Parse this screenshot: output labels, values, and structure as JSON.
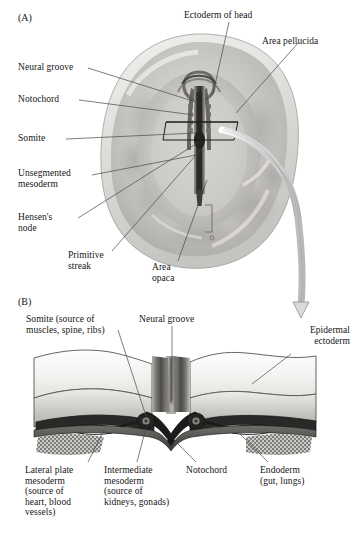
{
  "figure": {
    "domain_note": "two-panel embryology illustration",
    "panels": [
      {
        "tag": "(A)",
        "name": "dorsal-view-chick-embryo"
      },
      {
        "tag": "(B)",
        "name": "transverse-section-neural-groove"
      }
    ]
  },
  "panel_a": {
    "tag": "(A)",
    "labels": [
      {
        "id": "ectoderm-of-head",
        "text": "Ectoderm of head"
      },
      {
        "id": "area-pellucida",
        "text": "Area pellucida"
      },
      {
        "id": "neural-groove",
        "text": "Neural groove"
      },
      {
        "id": "notochord",
        "text": "Notochord"
      },
      {
        "id": "somite",
        "text": "Somite"
      },
      {
        "id": "unsegmented-mesoderm",
        "text": "Unsegmented\nmesoderm"
      },
      {
        "id": "hensens-node",
        "text": "Hensen's\nnode"
      },
      {
        "id": "primitive-streak",
        "text": "Primitive\nstreak"
      },
      {
        "id": "area-opaca",
        "text": "Area\nopaca"
      }
    ]
  },
  "panel_b": {
    "tag": "(B)",
    "labels": [
      {
        "id": "somite-source",
        "text": "Somite (source of\nmuscles, spine, ribs)"
      },
      {
        "id": "neural-groove",
        "text": "Neural groove"
      },
      {
        "id": "epidermal-ectoderm",
        "text": "Epidermal\nectoderm"
      },
      {
        "id": "lateral-plate-mesoderm",
        "text": "Lateral plate\nmesoderm\n(source of\nheart, blood\nvessels)"
      },
      {
        "id": "intermediate-mesoderm",
        "text": "Intermediate\nmesoderm\n(source of\nkidneys, gonads)"
      },
      {
        "id": "notochord",
        "text": "Notochord"
      },
      {
        "id": "endoderm",
        "text": "Endoderm\n(gut, lungs)"
      }
    ]
  },
  "colors": {
    "background": "#ffffff",
    "text": "#151515",
    "leader_line": "#4a4a4a",
    "embryo_light": "#e7e6e4",
    "embryo_mid": "#c4c2be",
    "embryo_dark": "#8f8d89",
    "streak_dark": "#3a3a3a",
    "arrow_fill": "#d8d8d8",
    "arrow_stroke": "#8a8a8a",
    "section_top": "#fcfcfc",
    "section_shade": "#b9b8b5",
    "mesoderm_dark": "#222222"
  }
}
